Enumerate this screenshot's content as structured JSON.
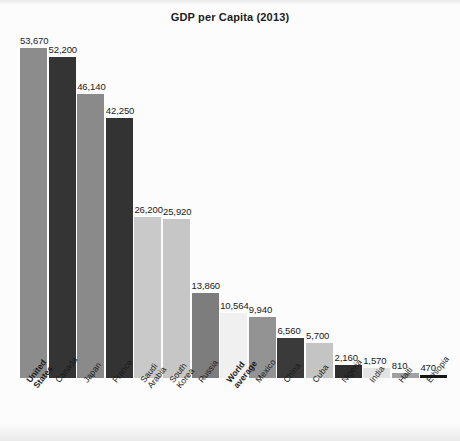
{
  "chart": {
    "title": "GDP per Capita (2013)"
  },
  "chart_data": {
    "type": "bar",
    "title": "GDP per Capita (2013)",
    "xlabel": "",
    "ylabel": "",
    "ylim": [
      0,
      53670
    ],
    "grid": false,
    "legend": null,
    "categories": [
      "United States",
      "Canada",
      "Japan",
      "France",
      "Saudi Arabia",
      "South Korea",
      "Russia",
      "World average",
      "Mexico",
      "China",
      "Cuba",
      "Nigeria",
      "India",
      "Haiti",
      "Ethiopia"
    ],
    "values": [
      53670,
      52200,
      46140,
      42250,
      26200,
      25920,
      13860,
      10564,
      9940,
      6560,
      5700,
      2160,
      1570,
      810,
      470
    ],
    "value_labels": [
      "53,670",
      "52,200",
      "46,140",
      "42,250",
      "26,200",
      "25,920",
      "13,860",
      "10,564",
      "9,940",
      "6,560",
      "5,700",
      "2,160",
      "1,570",
      "810",
      "470"
    ],
    "bar_colors": [
      "#8c8c8c",
      "#343434",
      "#8a8a8a",
      "#333333",
      "#c9c9c9",
      "#c6c6c6",
      "#7d7d7d",
      "#f0f0f0",
      "#939393",
      "#3a3a3a",
      "#c4c4c4",
      "#2e2e2e",
      "#e4e4e4",
      "#a0a0a0",
      "#151515"
    ],
    "emphasized": [
      "United States",
      "World average"
    ]
  },
  "bars": [
    {
      "label_line1": "United",
      "label_line2": "States",
      "value_label": "53,670",
      "bold": true
    },
    {
      "label_line1": "Canada",
      "label_line2": "",
      "value_label": "52,200",
      "bold": false
    },
    {
      "label_line1": "Japan",
      "label_line2": "",
      "value_label": "46,140",
      "bold": false
    },
    {
      "label_line1": "France",
      "label_line2": "",
      "value_label": "42,250",
      "bold": false
    },
    {
      "label_line1": "Saudi",
      "label_line2": "Arabia",
      "value_label": "26,200",
      "bold": false
    },
    {
      "label_line1": "South",
      "label_line2": "Korea",
      "value_label": "25,920",
      "bold": false
    },
    {
      "label_line1": "Russia",
      "label_line2": "",
      "value_label": "13,860",
      "bold": false
    },
    {
      "label_line1": "World",
      "label_line2": "average",
      "value_label": "10,564",
      "bold": true
    },
    {
      "label_line1": "Mexico",
      "label_line2": "",
      "value_label": "9,940",
      "bold": false
    },
    {
      "label_line1": "China",
      "label_line2": "",
      "value_label": "6,560",
      "bold": false
    },
    {
      "label_line1": "Cuba",
      "label_line2": "",
      "value_label": "5,700",
      "bold": false
    },
    {
      "label_line1": "Nigeria",
      "label_line2": "",
      "value_label": "2,160",
      "bold": false
    },
    {
      "label_line1": "India",
      "label_line2": "",
      "value_label": "1,570",
      "bold": false
    },
    {
      "label_line1": "Haiti",
      "label_line2": "",
      "value_label": "810",
      "bold": false
    },
    {
      "label_line1": "Ethiopia",
      "label_line2": "",
      "value_label": "470",
      "bold": false
    }
  ]
}
